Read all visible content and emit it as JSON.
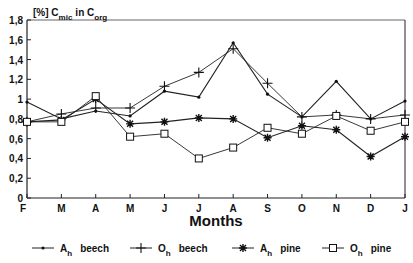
{
  "chart_data": {
    "type": "line",
    "title": "",
    "ylabel_parts": {
      "prefix": "[%] C",
      "sub1": "mic",
      "mid": "in  C",
      "sub2": "org"
    },
    "ylabel": "[%] Cmic in Corg",
    "xlabel": "Months",
    "categories": [
      "F",
      "M",
      "A",
      "M",
      "J",
      "J",
      "A",
      "S",
      "O",
      "N",
      "D",
      "J"
    ],
    "yticks": [
      "0",
      "0,2",
      "0,4",
      "0,6",
      "0,8",
      "1",
      "1,2",
      "1,4",
      "1,6",
      "1,8"
    ],
    "ylim": [
      0,
      1.8
    ],
    "grid": false,
    "legend_position": "bottom",
    "series": [
      {
        "name": "Ah beech",
        "base": "A",
        "sub": "h",
        "label": "beech",
        "marker": "dot",
        "values": [
          0.97,
          0.8,
          0.88,
          0.83,
          1.08,
          1.02,
          1.57,
          1.05,
          0.82,
          1.18,
          0.8,
          0.98
        ]
      },
      {
        "name": "Oh beech",
        "base": "O",
        "sub": "h",
        "label": "beech",
        "marker": "plus",
        "values": [
          0.77,
          0.85,
          0.91,
          0.91,
          1.13,
          1.27,
          1.51,
          1.16,
          0.82,
          0.84,
          0.8,
          0.84
        ]
      },
      {
        "name": "Ah pine",
        "base": "A",
        "sub": "h",
        "label": "pine",
        "marker": "star",
        "values": [
          0.77,
          0.79,
          1.0,
          0.75,
          0.77,
          0.81,
          0.8,
          0.61,
          0.73,
          0.69,
          0.42,
          0.62
        ]
      },
      {
        "name": "Oh pine",
        "base": "O",
        "sub": "h",
        "label": "pine",
        "marker": "square",
        "values": [
          0.77,
          0.77,
          1.03,
          0.62,
          0.65,
          0.4,
          0.51,
          0.71,
          0.65,
          0.83,
          0.68,
          0.77
        ]
      }
    ]
  },
  "legend": [
    {
      "base": "A",
      "sub": "h",
      "label": "beech"
    },
    {
      "base": "O",
      "sub": "h",
      "label": "beech"
    },
    {
      "base": "A",
      "sub": "h",
      "label": "pine"
    },
    {
      "base": "O",
      "sub": "h",
      "label": "pine"
    }
  ]
}
